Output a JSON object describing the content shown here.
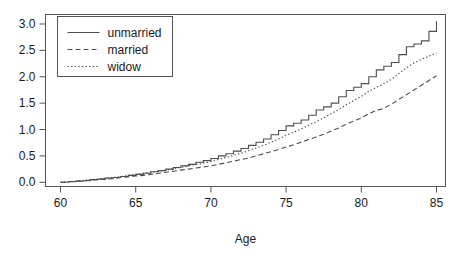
{
  "chart_data": {
    "type": "line",
    "title": "",
    "xlabel": "Age",
    "ylabel": "",
    "xlim": [
      59.0,
      85.6
    ],
    "ylim": [
      -0.08,
      3.18
    ],
    "xticks": [
      60,
      65,
      70,
      75,
      80,
      85
    ],
    "yticks": [
      0.0,
      0.5,
      1.0,
      1.5,
      2.0,
      2.5,
      3.0
    ],
    "xtick_labels": [
      "60",
      "65",
      "70",
      "75",
      "80",
      "85"
    ],
    "ytick_labels": [
      "0.0",
      "0.5",
      "1.0",
      "1.5",
      "2.0",
      "2.5",
      "3.0"
    ],
    "grid": false,
    "frame": true,
    "legend_position": "top-left",
    "line_color": "#4d4d4d",
    "axis_color": "#555555",
    "series": [
      {
        "name": "unmarried",
        "style": "solid",
        "step": true,
        "x": [
          60.0,
          60.5,
          61.0,
          61.5,
          62.0,
          62.5,
          63.0,
          63.5,
          64.0,
          64.5,
          65.0,
          65.5,
          66.0,
          66.5,
          67.0,
          67.5,
          68.0,
          68.5,
          69.0,
          69.5,
          70.0,
          70.5,
          71.0,
          71.5,
          72.0,
          72.5,
          73.0,
          73.5,
          74.0,
          74.5,
          75.0,
          75.5,
          76.0,
          76.5,
          77.0,
          77.5,
          78.0,
          78.5,
          79.0,
          79.5,
          80.0,
          80.5,
          81.0,
          81.5,
          82.0,
          82.5,
          83.0,
          83.5,
          84.0,
          84.5,
          85.0
        ],
        "y": [
          0.0,
          0.01,
          0.02,
          0.03,
          0.05,
          0.06,
          0.08,
          0.09,
          0.11,
          0.13,
          0.15,
          0.17,
          0.2,
          0.22,
          0.25,
          0.28,
          0.31,
          0.34,
          0.38,
          0.41,
          0.45,
          0.5,
          0.54,
          0.59,
          0.64,
          0.7,
          0.76,
          0.82,
          0.9,
          0.98,
          1.07,
          1.12,
          1.18,
          1.27,
          1.37,
          1.43,
          1.5,
          1.62,
          1.74,
          1.8,
          1.87,
          2.0,
          2.13,
          2.2,
          2.27,
          2.42,
          2.57,
          2.62,
          2.68,
          2.86,
          3.05
        ]
      },
      {
        "name": "married",
        "style": "dashed",
        "step": false,
        "x": [
          60.0,
          60.5,
          61.0,
          61.5,
          62.0,
          62.5,
          63.0,
          63.5,
          64.0,
          64.5,
          65.0,
          65.5,
          66.0,
          66.5,
          67.0,
          67.5,
          68.0,
          68.5,
          69.0,
          69.5,
          70.0,
          70.5,
          71.0,
          71.5,
          72.0,
          72.5,
          73.0,
          73.5,
          74.0,
          74.5,
          75.0,
          75.5,
          76.0,
          76.5,
          77.0,
          77.5,
          78.0,
          78.5,
          79.0,
          79.5,
          80.0,
          80.5,
          81.0,
          81.5,
          82.0,
          82.5,
          83.0,
          83.5,
          84.0,
          84.5,
          85.0
        ],
        "y": [
          0.0,
          0.01,
          0.02,
          0.03,
          0.04,
          0.05,
          0.06,
          0.07,
          0.09,
          0.1,
          0.12,
          0.13,
          0.15,
          0.17,
          0.19,
          0.21,
          0.23,
          0.25,
          0.27,
          0.29,
          0.31,
          0.34,
          0.37,
          0.4,
          0.43,
          0.46,
          0.5,
          0.54,
          0.58,
          0.62,
          0.67,
          0.71,
          0.76,
          0.81,
          0.86,
          0.91,
          0.97,
          1.03,
          1.1,
          1.16,
          1.22,
          1.3,
          1.36,
          1.4,
          1.48,
          1.57,
          1.66,
          1.75,
          1.84,
          1.93,
          2.02
        ]
      },
      {
        "name": "widow",
        "style": "dotted",
        "step": false,
        "x": [
          60.0,
          60.5,
          61.0,
          61.5,
          62.0,
          62.5,
          63.0,
          63.5,
          64.0,
          64.5,
          65.0,
          65.5,
          66.0,
          66.5,
          67.0,
          67.5,
          68.0,
          68.5,
          69.0,
          69.5,
          70.0,
          70.5,
          71.0,
          71.5,
          72.0,
          72.5,
          73.0,
          73.5,
          74.0,
          74.5,
          75.0,
          75.5,
          76.0,
          76.5,
          77.0,
          77.5,
          78.0,
          78.5,
          79.0,
          79.5,
          80.0,
          80.5,
          81.0,
          81.5,
          82.0,
          82.5,
          83.0,
          83.5,
          84.0,
          84.5,
          85.0
        ],
        "y": [
          0.0,
          0.01,
          0.02,
          0.03,
          0.05,
          0.06,
          0.08,
          0.09,
          0.11,
          0.13,
          0.15,
          0.17,
          0.19,
          0.21,
          0.23,
          0.26,
          0.28,
          0.31,
          0.34,
          0.36,
          0.39,
          0.43,
          0.47,
          0.51,
          0.55,
          0.6,
          0.65,
          0.7,
          0.76,
          0.82,
          0.89,
          0.95,
          1.01,
          1.08,
          1.15,
          1.22,
          1.3,
          1.38,
          1.47,
          1.55,
          1.63,
          1.72,
          1.8,
          1.87,
          1.95,
          2.06,
          2.17,
          2.26,
          2.33,
          2.39,
          2.45
        ]
      }
    ],
    "legend": [
      {
        "label": "unmarried",
        "style": "solid"
      },
      {
        "label": "married",
        "style": "dashed"
      },
      {
        "label": "widow",
        "style": "dotted"
      }
    ]
  }
}
